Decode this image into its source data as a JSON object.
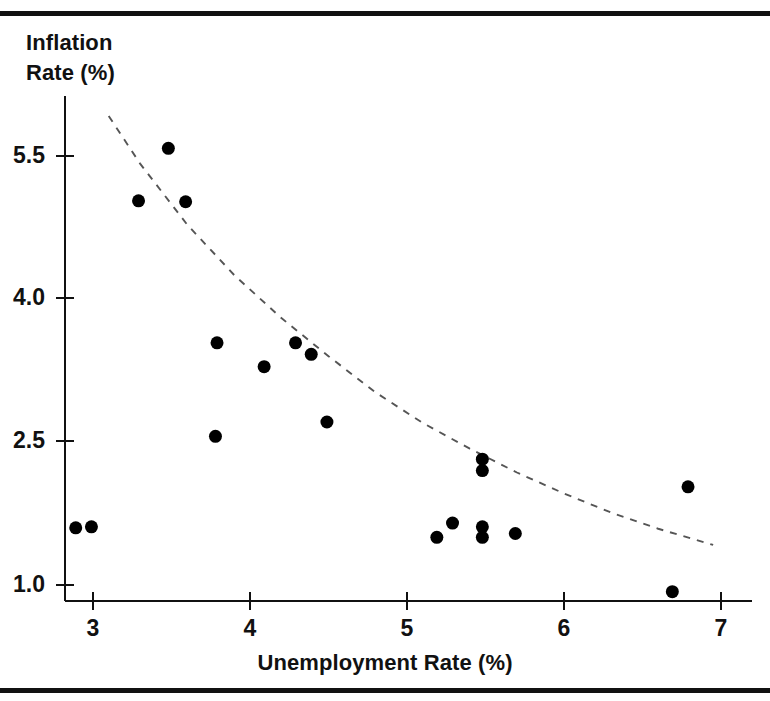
{
  "figure": {
    "rules": [
      "top-rule",
      "bottom-rule"
    ]
  },
  "chart_data": {
    "type": "scatter",
    "title": "",
    "xlabel": "Unemployment Rate (%)",
    "ylabel": "Inflation\nRate (%)",
    "ylabel_line1": "Inflation",
    "ylabel_line2": "Rate (%)",
    "xlim": [
      2.75,
      7.2
    ],
    "ylim": [
      0.75,
      6.1
    ],
    "xticks": [
      3,
      4,
      5,
      6,
      7
    ],
    "xtick_labels": [
      "3",
      "4",
      "5",
      "6",
      "7"
    ],
    "yticks": [
      1.0,
      2.5,
      4.0,
      5.5
    ],
    "ytick_labels": [
      "1.0",
      "2.5",
      "4.0",
      "5.5"
    ],
    "grid": false,
    "legend": "none",
    "marker": {
      "shape": "circle",
      "color": "#000000",
      "size_px": 13
    },
    "series": [
      {
        "name": "Observations",
        "points": [
          {
            "x": 2.89,
            "y": 1.6
          },
          {
            "x": 2.99,
            "y": 1.61
          },
          {
            "x": 3.29,
            "y": 5.03
          },
          {
            "x": 3.48,
            "y": 5.58
          },
          {
            "x": 3.59,
            "y": 5.02
          },
          {
            "x": 3.79,
            "y": 3.54
          },
          {
            "x": 3.78,
            "y": 2.56
          },
          {
            "x": 4.09,
            "y": 3.29
          },
          {
            "x": 4.29,
            "y": 3.54
          },
          {
            "x": 4.39,
            "y": 3.42
          },
          {
            "x": 4.49,
            "y": 2.71
          },
          {
            "x": 5.19,
            "y": 1.5
          },
          {
            "x": 5.29,
            "y": 1.65
          },
          {
            "x": 5.48,
            "y": 2.32
          },
          {
            "x": 5.48,
            "y": 2.2
          },
          {
            "x": 5.48,
            "y": 1.61
          },
          {
            "x": 5.48,
            "y": 1.5
          },
          {
            "x": 5.69,
            "y": 1.54
          },
          {
            "x": 6.69,
            "y": 0.93
          },
          {
            "x": 6.79,
            "y": 2.03
          }
        ]
      }
    ],
    "fitted_curve": {
      "name": "Fitted Phillips curve",
      "style": "dashed",
      "color": "#555555",
      "points": [
        {
          "x": 3.1,
          "y": 5.92
        },
        {
          "x": 3.3,
          "y": 5.42
        },
        {
          "x": 3.6,
          "y": 4.78
        },
        {
          "x": 3.9,
          "y": 4.25
        },
        {
          "x": 4.2,
          "y": 3.8
        },
        {
          "x": 4.5,
          "y": 3.4
        },
        {
          "x": 4.8,
          "y": 3.02
        },
        {
          "x": 5.1,
          "y": 2.7
        },
        {
          "x": 5.4,
          "y": 2.43
        },
        {
          "x": 5.7,
          "y": 2.18
        },
        {
          "x": 6.0,
          "y": 1.96
        },
        {
          "x": 6.3,
          "y": 1.76
        },
        {
          "x": 6.6,
          "y": 1.59
        },
        {
          "x": 6.95,
          "y": 1.42
        }
      ]
    }
  },
  "axes": {
    "x_tick_positions_px": [
      93,
      250,
      407,
      564,
      721
    ],
    "y_tick_positions_px": [
      585,
      441,
      298,
      156
    ],
    "x_axis_y_px": 601,
    "y_axis_x_px": 65
  }
}
